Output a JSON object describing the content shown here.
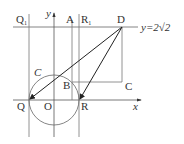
{
  "figure": {
    "line_label": "y=2√2",
    "axis_labels": {
      "x": "x",
      "y": "y"
    },
    "points": {
      "Q1": {
        "label": "Q",
        "subscript": "1"
      },
      "A": {
        "label": "A"
      },
      "R1": {
        "label": "R",
        "subscript": "1"
      },
      "D": {
        "label": "D"
      },
      "C_curve": {
        "label": "C"
      },
      "B": {
        "label": "B"
      },
      "C_point": {
        "label": "C"
      },
      "Q": {
        "label": "Q"
      },
      "O": {
        "label": "O"
      },
      "R": {
        "label": "R"
      }
    },
    "colors": {
      "line": "#555555",
      "arrow": "#222222",
      "text": "#333333"
    }
  }
}
